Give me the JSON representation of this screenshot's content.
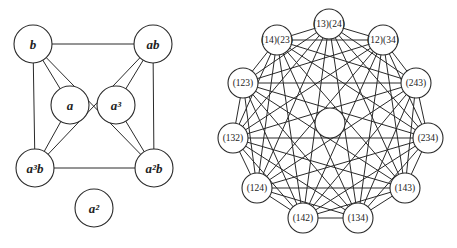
{
  "left_graph": {
    "nodes": [
      {
        "id": "b",
        "label": "b",
        "x": 33,
        "y": 44,
        "r": 19
      },
      {
        "id": "ab",
        "label": "ab",
        "x": 153,
        "y": 44,
        "r": 19
      },
      {
        "id": "a",
        "label": "a",
        "x": 70,
        "y": 105,
        "r": 19
      },
      {
        "id": "a3",
        "label": "a³",
        "x": 116,
        "y": 105,
        "r": 19
      },
      {
        "id": "a3b",
        "label": "a³b",
        "x": 35,
        "y": 168,
        "r": 19
      },
      {
        "id": "a2b",
        "label": "a²b",
        "x": 154,
        "y": 168,
        "r": 19
      },
      {
        "id": "a2",
        "label": "a²",
        "x": 94,
        "y": 208,
        "r": 19
      }
    ],
    "edges": [
      [
        "b",
        "ab"
      ],
      [
        "b",
        "a3b"
      ],
      [
        "ab",
        "a2b"
      ],
      [
        "a3b",
        "a2b"
      ],
      [
        "b",
        "a"
      ],
      [
        "b",
        "a2b"
      ],
      [
        "ab",
        "a3"
      ],
      [
        "ab",
        "a3b"
      ],
      [
        "a3b",
        "a"
      ],
      [
        "a2b",
        "a3"
      ]
    ]
  },
  "right_graph": {
    "nodes": [
      {
        "id": "n1324",
        "label": "(13)(24)",
        "x": 329,
        "y": 24,
        "r": 15
      },
      {
        "id": "n1234",
        "label": "(12)(34)",
        "x": 383,
        "y": 40,
        "r": 15
      },
      {
        "id": "n243",
        "label": "(243)",
        "x": 416,
        "y": 83,
        "r": 15
      },
      {
        "id": "n234",
        "label": "(234)",
        "x": 428,
        "y": 138,
        "r": 15
      },
      {
        "id": "n143",
        "label": "(143)",
        "x": 405,
        "y": 188,
        "r": 15
      },
      {
        "id": "n134",
        "label": "(134)",
        "x": 358,
        "y": 218,
        "r": 15
      },
      {
        "id": "n142",
        "label": "(142)",
        "x": 303,
        "y": 218,
        "r": 15
      },
      {
        "id": "n124",
        "label": "(124)",
        "x": 257,
        "y": 188,
        "r": 15
      },
      {
        "id": "n132",
        "label": "(132)",
        "x": 233,
        "y": 138,
        "r": 15
      },
      {
        "id": "n123",
        "label": "(123)",
        "x": 243,
        "y": 83,
        "r": 15
      },
      {
        "id": "n1423",
        "label": "(14)(23)",
        "x": 277,
        "y": 40,
        "r": 15
      },
      {
        "id": "center",
        "label": "",
        "x": 330,
        "y": 123,
        "r": 15
      }
    ],
    "complete_among_outer": true
  }
}
